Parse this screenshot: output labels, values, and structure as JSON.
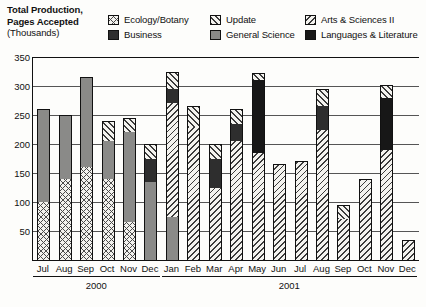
{
  "header": {
    "axis_title_line1": "Total Production,",
    "axis_title_line2": "Pages Accepted",
    "axis_title_line3": "(Thousands)"
  },
  "legend": {
    "items": [
      {
        "label": "Ecology/Botany",
        "key": "ecology",
        "pattern": "cross-hatch",
        "color": "#4a4a4a"
      },
      {
        "label": "Business",
        "key": "business",
        "pattern": "solid-dark",
        "color": "#2e2e2e"
      },
      {
        "label": "Update",
        "key": "update",
        "pattern": "diagonal-forward",
        "color": "#3c3c3c"
      },
      {
        "label": "General Science",
        "key": "genscience",
        "pattern": "solid-gray",
        "color": "#8a8a88"
      },
      {
        "label": "Arts & Sciences II",
        "key": "arts",
        "pattern": "diagonal-backward",
        "color": "#3c3c3c"
      },
      {
        "label": "Languages & Literature",
        "key": "languages",
        "pattern": "solid-black",
        "color": "#171717"
      }
    ]
  },
  "chart_data": {
    "type": "bar",
    "subtype": "stacked",
    "title": "Total Production, Pages Accepted (Thousands)",
    "xlabel": "",
    "ylabel": "Total Production, Pages Accepted (Thousands)",
    "ylim": [
      0,
      350
    ],
    "yticks": [
      50,
      100,
      150,
      200,
      250,
      300,
      350
    ],
    "grid": true,
    "legend_position": "top",
    "categories": [
      "Jul",
      "Aug",
      "Sep",
      "Oct",
      "Nov",
      "Dec",
      "Jan",
      "Feb",
      "Mar",
      "Apr",
      "May",
      "Jun",
      "Jul",
      "Aug",
      "Sep",
      "Oct",
      "Nov",
      "Dec"
    ],
    "year_groups": [
      {
        "label": "2000",
        "start": 0,
        "end": 5
      },
      {
        "label": "2001",
        "start": 6,
        "end": 17
      }
    ],
    "series": [
      {
        "name": "Ecology/Botany",
        "key": "ecology",
        "values": [
          100,
          140,
          160,
          140,
          65,
          0,
          0,
          0,
          0,
          0,
          0,
          0,
          0,
          0,
          0,
          0,
          0,
          0
        ]
      },
      {
        "name": "General Science",
        "key": "genscience",
        "values": [
          160,
          110,
          155,
          65,
          155,
          135,
          75,
          0,
          0,
          0,
          0,
          0,
          0,
          0,
          0,
          0,
          0,
          0
        ]
      },
      {
        "name": "Business",
        "key": "business",
        "values": [
          0,
          0,
          0,
          0,
          0,
          40,
          25,
          0,
          50,
          30,
          0,
          0,
          0,
          40,
          0,
          0,
          0,
          0
        ]
      },
      {
        "name": "Update",
        "key": "update",
        "values": [
          0,
          0,
          0,
          35,
          25,
          25,
          30,
          35,
          25,
          25,
          12,
          0,
          0,
          30,
          25,
          0,
          22,
          0
        ]
      },
      {
        "name": "Arts & Sciences II",
        "key": "arts",
        "values": [
          0,
          0,
          0,
          0,
          0,
          0,
          195,
          230,
          125,
          205,
          185,
          165,
          170,
          225,
          70,
          140,
          190,
          35
        ]
      },
      {
        "name": "Languages & Literature",
        "key": "languages",
        "values": [
          0,
          0,
          0,
          0,
          0,
          0,
          0,
          0,
          0,
          0,
          125,
          0,
          0,
          0,
          0,
          0,
          90,
          0
        ]
      }
    ],
    "totals": [
      260,
      250,
      315,
      240,
      245,
      200,
      325,
      265,
      200,
      260,
      322,
      165,
      170,
      295,
      95,
      140,
      302,
      35
    ]
  }
}
